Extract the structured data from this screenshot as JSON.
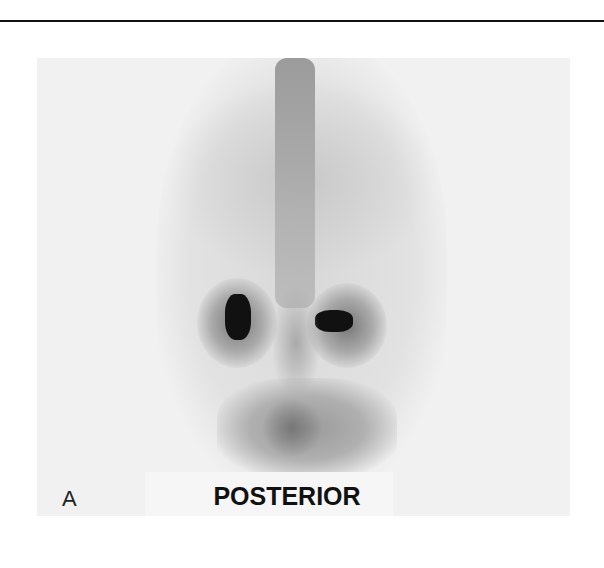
{
  "figure": {
    "panel_label": "A",
    "view_label": "POSTERIOR",
    "image_description": "posterior whole-body nuclear scan, torso with spine, ribs, kidneys and pelvis"
  },
  "colors": {
    "background": "#ffffff",
    "panel_background": "#f1f1f1",
    "rule": "#111111",
    "high_uptake": "#111111"
  }
}
